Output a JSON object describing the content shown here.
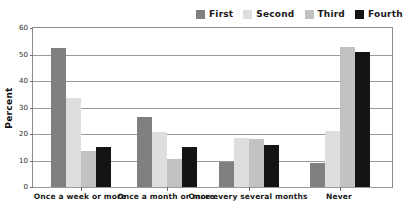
{
  "chart_data": {
    "type": "bar",
    "title": "",
    "subtitle": "",
    "xlabel": "",
    "ylabel": "Percent",
    "ylim": [
      0,
      60
    ],
    "yticks": [
      0,
      10,
      20,
      30,
      40,
      50,
      60
    ],
    "ytick_labels": [
      "0",
      "10",
      "20",
      "30",
      "40",
      "50",
      "60"
    ],
    "grid": true,
    "legend_position": "top-right",
    "orientation": "vertical",
    "grouping": "grouped",
    "categories": [
      "Once a week or more",
      "Once a month or more",
      "Once every several months",
      "Never"
    ],
    "series": [
      {
        "name": "First",
        "color": "#808080",
        "values": [
          52.5,
          26.5,
          9.5,
          9.0
        ]
      },
      {
        "name": "Second",
        "color": "#dedede",
        "values": [
          33.5,
          20.7,
          18.6,
          21.3
        ]
      },
      {
        "name": "Third",
        "color": "#c2c2c2",
        "values": [
          13.5,
          10.5,
          18.0,
          53.0
        ]
      },
      {
        "name": "Fourth",
        "color": "#141414",
        "values": [
          15.0,
          15.0,
          15.8,
          51.0
        ]
      }
    ]
  },
  "legend": {
    "items": [
      {
        "label": "First",
        "color": "#808080"
      },
      {
        "label": "Second",
        "color": "#dedede"
      },
      {
        "label": "Third",
        "color": "#c2c2c2"
      },
      {
        "label": "Fourth",
        "color": "#141414"
      }
    ]
  },
  "axes": {
    "y_title": "Percent",
    "y_tick_labels": [
      "60",
      "50",
      "40",
      "30",
      "20",
      "10",
      "0"
    ],
    "x_tick_labels": [
      "Once a week or more",
      "Once a month or more",
      "Once every several months",
      "Never"
    ]
  },
  "style": {
    "plot_background": "#ffffff",
    "frame_color": "#8d8d8d",
    "grid_color": "#9a9a9a",
    "text_color": "#1a1a1a"
  }
}
